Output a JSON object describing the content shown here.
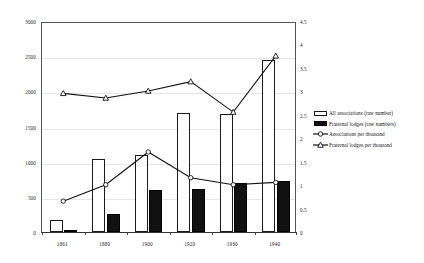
{
  "chart_data": {
    "type": "bar",
    "title": "",
    "subtitle": "",
    "xlabel": "",
    "ylabel": "",
    "categories": [
      "1861",
      "1880",
      "1900",
      "1920",
      "1930",
      "1940"
    ],
    "grid": true,
    "legend_position": "right",
    "axes": {
      "left": {
        "label": "",
        "ylim": [
          0,
          3000
        ],
        "ticks": [
          "0",
          "500",
          "1000",
          "1500",
          "2000",
          "2500",
          "3000"
        ],
        "tick_values": [
          0,
          500,
          1000,
          1500,
          2000,
          2500,
          3000
        ]
      },
      "right": {
        "label": "",
        "ylim": [
          0,
          4.5
        ],
        "ticks": [
          "0",
          "0.5",
          "1",
          "1.5",
          "2",
          "2.5",
          "3",
          "3.5",
          "4",
          "4.5"
        ],
        "tick_values": [
          0,
          0.5,
          1,
          1.5,
          2,
          2.5,
          3,
          3.5,
          4,
          4.5
        ]
      }
    },
    "series": [
      {
        "name": "All associations (raw number)",
        "type": "bar",
        "axis": "left",
        "style": "white-fill-black-outline",
        "values": [
          175,
          1040,
          1100,
          1690,
          1675,
          2450
        ]
      },
      {
        "name": "Fraternal lodges (raw numbers)",
        "type": "bar",
        "axis": "left",
        "style": "black-fill",
        "values": [
          35,
          250,
          600,
          610,
          690,
          720
        ]
      },
      {
        "name": "Associations per thousand",
        "type": "line",
        "axis": "right",
        "marker": "circle",
        "values": [
          0.7,
          1.05,
          1.75,
          1.2,
          1.05,
          1.1
        ]
      },
      {
        "name": "Fraternal lodges per thousand",
        "type": "line",
        "axis": "right",
        "marker": "triangle",
        "values": [
          3.0,
          2.9,
          3.05,
          3.25,
          2.6,
          3.8
        ]
      }
    ],
    "colors": {
      "all_associations_fill": "#ffffff",
      "all_associations_stroke": "#1a1a1a",
      "fraternal_lodges_fill": "#111111",
      "line_stroke": "#111111",
      "gridline": "#e6e6e6",
      "axis": "#555555"
    }
  },
  "legend": {
    "items": [
      {
        "label": "All associations (raw number)",
        "key": "white-swatch"
      },
      {
        "label": "Fraternal lodges (raw numbers)",
        "key": "black-swatch"
      },
      {
        "label": "Associations per thousand",
        "key": "circle-marker-line"
      },
      {
        "label": "Fraternal lodges per thousand",
        "key": "triangle-marker-line"
      }
    ]
  }
}
